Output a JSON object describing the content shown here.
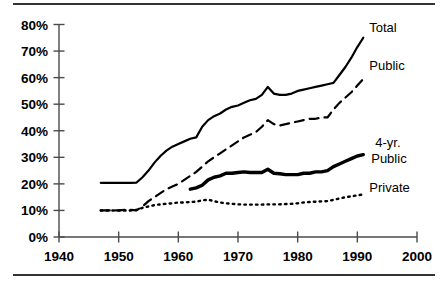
{
  "figure": {
    "name": "enrollment-rate-line-chart",
    "background": "#ffffff",
    "ink_color": "#000000",
    "axis_color": "#4a4a4a",
    "rule_color": "#333333"
  },
  "chart_data": {
    "type": "line",
    "title": "",
    "subtitle": "",
    "xlabel": "",
    "ylabel": "",
    "xlim": [
      1940,
      2000
    ],
    "ylim": [
      0,
      80
    ],
    "xticks": [
      1940,
      1950,
      1960,
      1970,
      1980,
      1990,
      2000
    ],
    "xtick_labels": [
      "1940",
      "1950",
      "1960",
      "1970",
      "1980",
      "1990",
      "2000"
    ],
    "yticks": [
      0,
      10,
      20,
      30,
      40,
      50,
      60,
      70,
      80
    ],
    "ytick_labels": [
      "0%",
      "10%",
      "20%",
      "30%",
      "40%",
      "50%",
      "60%",
      "70%",
      "80%"
    ],
    "grid": false,
    "legend_position": "right-inline-labels",
    "series": [
      {
        "name": "Total",
        "label": "Total",
        "style": "solid",
        "linewidth": 2.2,
        "label_x": 1992,
        "label_y": 77,
        "x": [
          1947,
          1948,
          1949,
          1950,
          1951,
          1952,
          1953,
          1954,
          1955,
          1956,
          1957,
          1958,
          1959,
          1960,
          1961,
          1962,
          1963,
          1964,
          1965,
          1966,
          1967,
          1968,
          1969,
          1970,
          1971,
          1972,
          1973,
          1974,
          1975,
          1976,
          1977,
          1978,
          1979,
          1980,
          1981,
          1982,
          1983,
          1984,
          1985,
          1986,
          1987,
          1988,
          1989,
          1990,
          1991
        ],
        "y": [
          20.4,
          20.4,
          20.4,
          20.4,
          20.4,
          20.4,
          20.5,
          22.5,
          25.0,
          28.0,
          30.5,
          32.5,
          34.0,
          35.0,
          36.0,
          37.0,
          37.5,
          41.5,
          44.0,
          45.5,
          46.5,
          48.0,
          49.0,
          49.5,
          50.5,
          51.5,
          52.0,
          53.5,
          56.5,
          54.0,
          53.5,
          53.5,
          54.0,
          55.0,
          55.5,
          56.0,
          56.5,
          57.0,
          57.5,
          58.0,
          61.0,
          64.0,
          67.5,
          71.5,
          75.0
        ]
      },
      {
        "name": "Public",
        "label": "Public",
        "style": "dashed",
        "linewidth": 2.2,
        "label_x": 1992,
        "label_y": 63,
        "x": [
          1947,
          1948,
          1949,
          1950,
          1951,
          1952,
          1953,
          1954,
          1955,
          1956,
          1957,
          1958,
          1959,
          1960,
          1961,
          1962,
          1963,
          1964,
          1965,
          1966,
          1967,
          1968,
          1969,
          1970,
          1971,
          1972,
          1973,
          1974,
          1975,
          1976,
          1977,
          1978,
          1979,
          1980,
          1981,
          1982,
          1983,
          1984,
          1985,
          1986,
          1987,
          1988,
          1989,
          1990,
          1991
        ],
        "y": [
          10.0,
          10.0,
          10.0,
          10.0,
          10.2,
          10.2,
          10.0,
          11.5,
          13.5,
          15.0,
          16.5,
          18.0,
          19.0,
          20.0,
          21.5,
          23.0,
          24.5,
          26.5,
          28.5,
          30.0,
          31.5,
          33.0,
          34.5,
          36.0,
          37.5,
          38.5,
          39.5,
          41.5,
          44.0,
          42.5,
          42.0,
          42.5,
          43.0,
          43.5,
          44.0,
          44.5,
          44.5,
          45.0,
          45.0,
          48.0,
          50.5,
          52.5,
          54.5,
          57.0,
          59.5
        ]
      },
      {
        "name": "4-yr. Public",
        "label": "4-yr.",
        "label_line2": "Public",
        "style": "solid-thick",
        "linewidth": 3.4,
        "label_x": 1993,
        "label_y": 34,
        "x": [
          1962,
          1963,
          1964,
          1965,
          1966,
          1967,
          1968,
          1969,
          1970,
          1971,
          1972,
          1973,
          1974,
          1975,
          1976,
          1977,
          1978,
          1979,
          1980,
          1981,
          1982,
          1983,
          1984,
          1985,
          1986,
          1987,
          1988,
          1989,
          1990,
          1991
        ],
        "y": [
          18.0,
          18.5,
          19.5,
          21.5,
          22.5,
          23.0,
          24.0,
          24.0,
          24.3,
          24.5,
          24.3,
          24.3,
          24.3,
          25.5,
          24.0,
          23.8,
          23.5,
          23.5,
          23.5,
          24.0,
          24.0,
          24.5,
          24.5,
          25.0,
          26.5,
          27.5,
          28.5,
          29.5,
          30.5,
          31.0
        ]
      },
      {
        "name": "Private",
        "label": "Private",
        "style": "dotted",
        "linewidth": 2.4,
        "label_x": 1992,
        "label_y": 17,
        "x": [
          1947,
          1948,
          1949,
          1950,
          1951,
          1952,
          1953,
          1954,
          1955,
          1956,
          1957,
          1958,
          1959,
          1960,
          1961,
          1962,
          1963,
          1964,
          1965,
          1966,
          1967,
          1968,
          1969,
          1970,
          1971,
          1972,
          1973,
          1974,
          1975,
          1976,
          1977,
          1978,
          1979,
          1980,
          1981,
          1982,
          1983,
          1984,
          1985,
          1986,
          1987,
          1988,
          1989,
          1990,
          1991
        ],
        "y": [
          10.0,
          10.0,
          10.0,
          10.0,
          10.0,
          10.0,
          10.2,
          11.0,
          11.5,
          12.0,
          12.3,
          12.5,
          12.7,
          13.0,
          13.0,
          13.2,
          13.3,
          13.8,
          14.0,
          13.5,
          13.0,
          12.7,
          12.5,
          12.3,
          12.2,
          12.2,
          12.2,
          12.2,
          12.3,
          12.3,
          12.3,
          12.4,
          12.5,
          12.7,
          13.0,
          13.2,
          13.3,
          13.4,
          13.5,
          14.0,
          14.5,
          15.0,
          15.3,
          15.7,
          16.0
        ]
      }
    ]
  }
}
